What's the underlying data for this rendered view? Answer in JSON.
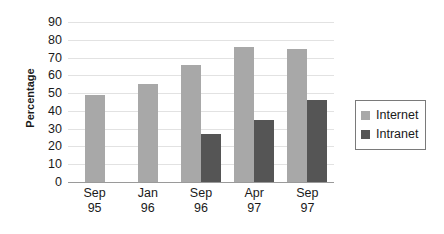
{
  "chart_data": {
    "type": "bar",
    "title": "",
    "xlabel": "",
    "ylabel": "Percentage",
    "ylim": [
      0,
      90
    ],
    "ytick_step": 10,
    "yticks": [
      90,
      80,
      70,
      60,
      50,
      40,
      30,
      20,
      10,
      0
    ],
    "grid": true,
    "legend_position": "right",
    "categories": [
      "Sep 95",
      "Jan 96",
      "Sep 96",
      "Apr 97",
      "Sep 97"
    ],
    "category_lines": [
      {
        "top": "Sep",
        "bottom": "95"
      },
      {
        "top": "Jan",
        "bottom": "96"
      },
      {
        "top": "Sep",
        "bottom": "96"
      },
      {
        "top": "Apr",
        "bottom": "97"
      },
      {
        "top": "Sep",
        "bottom": "97"
      }
    ],
    "series": [
      {
        "name": "Internet",
        "color": "#a8a8a8",
        "values": [
          49,
          55,
          66,
          76,
          75
        ]
      },
      {
        "name": "Intranet",
        "color": "#555555",
        "values": [
          null,
          null,
          27,
          35,
          46
        ]
      }
    ]
  },
  "legend": {
    "items": [
      {
        "label": "Internet",
        "color": "#a8a8a8"
      },
      {
        "label": "Intranet",
        "color": "#555555"
      }
    ]
  },
  "axis": {
    "y_title": "Percentage"
  }
}
